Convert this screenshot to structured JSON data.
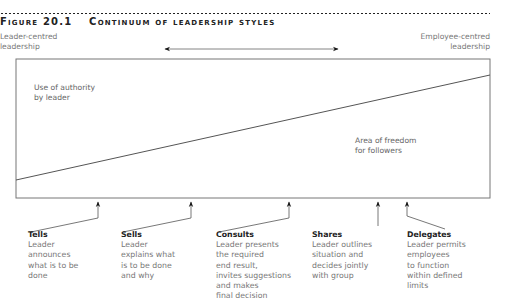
{
  "figure": {
    "number": "Figure 20.1",
    "title": "Continuum of leadership styles"
  },
  "axis": {
    "left_label": "Leader-centred\nleadership",
    "left_label_line1": "Leader-centred",
    "left_label_line2": "leadership",
    "right_label_line1": "Employee-centred",
    "right_label_line2": "leadership"
  },
  "regions": {
    "upper_line1": "Use of authority",
    "upper_line2": "by leader",
    "lower_line1": "Area of freedom",
    "lower_line2": "for followers"
  },
  "styles": [
    {
      "name": "Tells",
      "description": "Leader\nannounces\nwhat is to be\ndone"
    },
    {
      "name": "Sells",
      "description": "Leader\nexplains what\nis to be done\nand why"
    },
    {
      "name": "Consults",
      "description": "Leader presents\nthe required\nend result,\ninvites suggestions\nand makes\nfinal decision"
    },
    {
      "name": "Shares",
      "description": "Leader outlines\nsituation and\ndecides jointly\nwith group"
    },
    {
      "name": "Delegates",
      "description": "Leader permits\nemployees\nto function\nwithin defined\nlimits"
    }
  ],
  "colors": {
    "line": "#555555",
    "arrow": "#111111",
    "text": "#777777",
    "label": "#222222"
  }
}
